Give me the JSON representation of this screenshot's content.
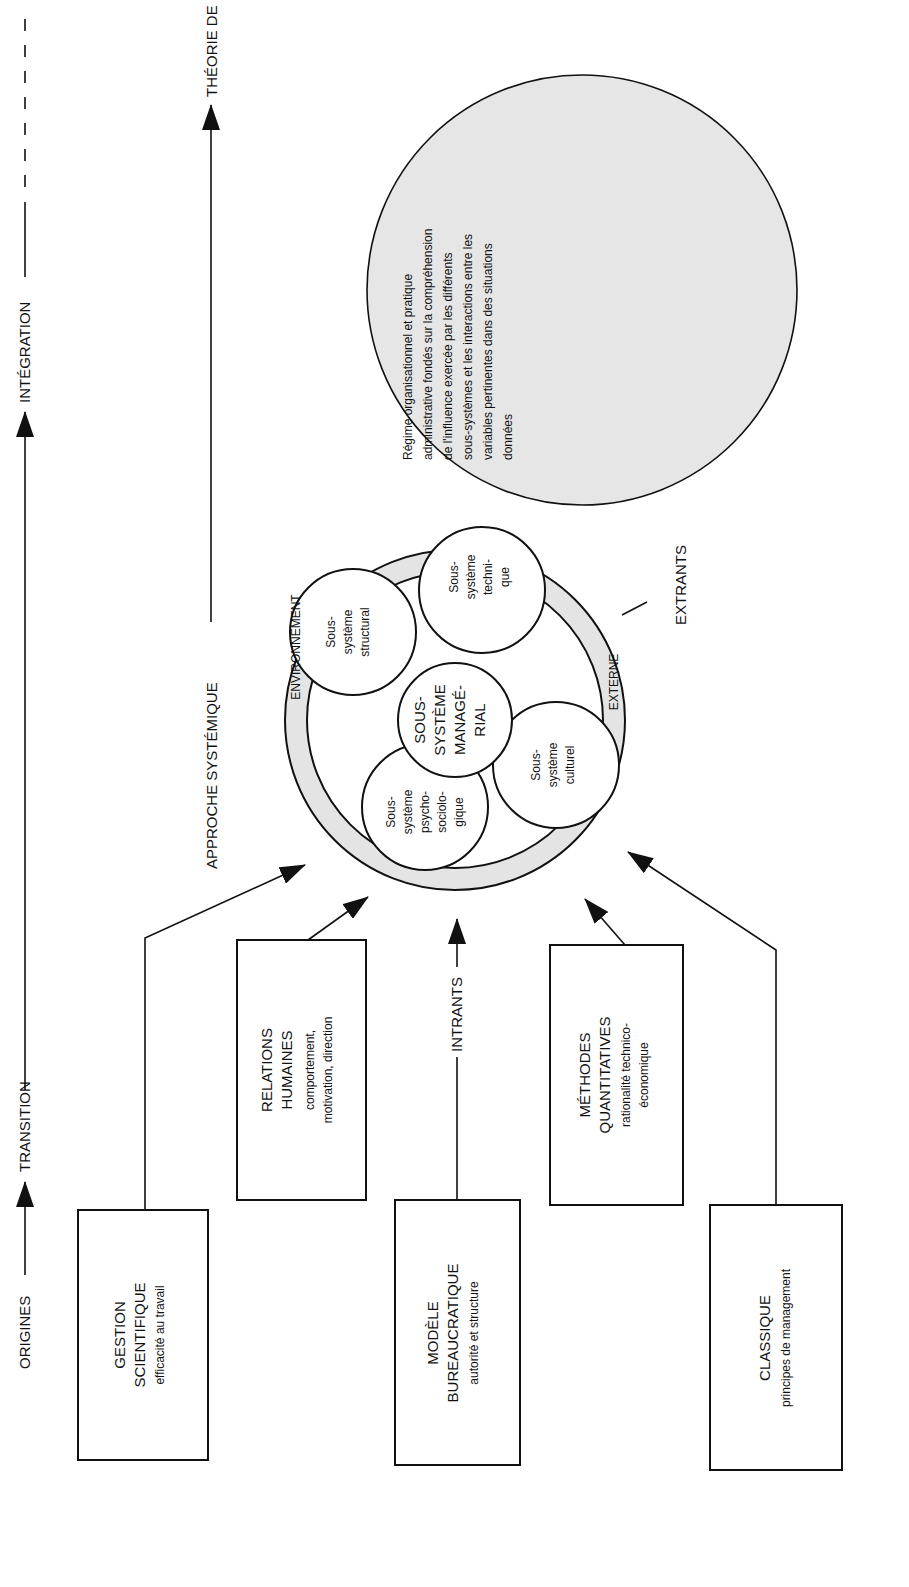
{
  "timeline": {
    "origins": "ORIGINES",
    "transition": "TRANSITION",
    "integration": "INTÉGRATION"
  },
  "approach": {
    "systemic": "APPROCHE SYSTÉMIQUE",
    "contingency": "THÉORIE DE LA CONTINGENCE"
  },
  "sources": [
    {
      "title1": "GESTION",
      "title2": "SCIENTIFIQUE",
      "desc1": "efficacité au travail",
      "desc2": ""
    },
    {
      "title1": "RELATIONS",
      "title2": "HUMAINES",
      "desc1": "comportement,",
      "desc2": "motivation, direction"
    },
    {
      "title1": "MODÈLE",
      "title2": "BUREAUCRATIQUE",
      "desc1": "autorité et structure",
      "desc2": ""
    },
    {
      "title1": "MÉTHODES",
      "title2": "QUANTITATIVES",
      "desc1": "rationalité technico-",
      "desc2": "économique"
    },
    {
      "title1": "CLASSIQUE",
      "title2": "",
      "desc1": "principes de management",
      "desc2": ""
    }
  ],
  "flows": {
    "inputs": "INTRANTS",
    "outputs": "EXTRANTS"
  },
  "system": {
    "env_left": "ENVIRONNEMENT",
    "env_right": "EXTERNE",
    "center": [
      "SOUS-",
      "SYSTÈME",
      "MANAGÉ-",
      "RIAL"
    ],
    "structural": [
      "Sous-",
      "système",
      "structural"
    ],
    "technical": [
      "Sous-",
      "système",
      "techni-",
      "que"
    ],
    "psycho": [
      "Sous-",
      "système",
      "psycho-",
      "sociolo-",
      "gique"
    ],
    "cultural": [
      "Sous-",
      "système",
      "culturel"
    ]
  },
  "contingency_text": [
    "Régime organisationnel et pratique",
    "administrative fondés sur la compréhension",
    "de l'influence exercée par les différents",
    "sous-systèmes et les interactions entre les",
    "variables pertinentes dans des situations",
    "données"
  ],
  "colors": {
    "ring": "#e4e4e4",
    "contingency_fill": "#e6e6e6",
    "ink": "#111111"
  }
}
